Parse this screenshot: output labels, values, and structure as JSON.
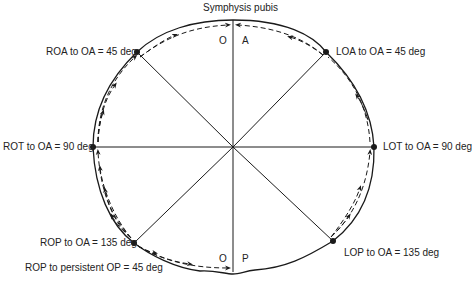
{
  "title": "Symphysis pubis",
  "quadrant_letters": {
    "top_left": "O",
    "top_right": "A",
    "bottom_left": "O",
    "bottom_right": "P"
  },
  "positions": [
    {
      "id": "roa",
      "label": "ROA to OA = 45 deg",
      "x": 137,
      "y": 52
    },
    {
      "id": "loa",
      "label": "LOA to OA = 45 deg",
      "x": 326,
      "y": 52
    },
    {
      "id": "rot",
      "label": "ROT to OA = 90 deg",
      "x": 93,
      "y": 147
    },
    {
      "id": "lot",
      "label": "LOT to OA = 90 deg",
      "x": 374,
      "y": 147
    },
    {
      "id": "rop",
      "label": "ROP to OA = 135 deg",
      "x": 134,
      "y": 243
    },
    {
      "id": "lop",
      "label": "LOP to OA = 135 deg",
      "x": 333,
      "y": 241
    }
  ],
  "extra_label": "ROP to persistent OP = 45 deg",
  "center": {
    "x": 233,
    "y": 147
  },
  "colors": {
    "line": "#1a1a1a",
    "background": "#ffffff"
  }
}
